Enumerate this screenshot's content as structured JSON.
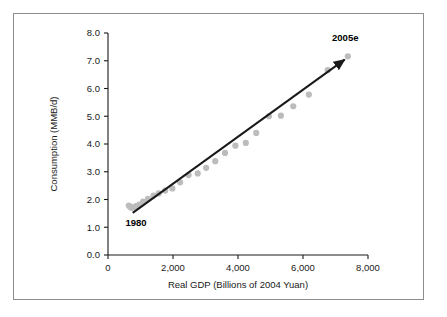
{
  "chart_data": {
    "type": "scatter",
    "title": "",
    "xlabel": "Real GDP (Billions of 2004 Yuan)",
    "ylabel": "Consumption (MMB/d)",
    "xlim": [
      0,
      8000
    ],
    "ylim": [
      0.0,
      8.0
    ],
    "xticks": [
      0,
      2000,
      4000,
      6000,
      8000
    ],
    "xtick_labels": [
      "0",
      "2,000",
      "4,000",
      "6,000",
      "8,000"
    ],
    "yticks": [
      0.0,
      1.0,
      2.0,
      3.0,
      4.0,
      5.0,
      6.0,
      7.0,
      8.0
    ],
    "ytick_labels": [
      "0.0",
      "1.0",
      "2.0",
      "3.0",
      "4.0",
      "5.0",
      "6.0",
      "7.0",
      "8.0"
    ],
    "grid": false,
    "legend": false,
    "marker_color": "#bcbcbc",
    "line_color": "#1a1a1a",
    "series": [
      {
        "name": "China oil consumption vs real GDP",
        "x": [
          640,
          680,
          720,
          780,
          860,
          960,
          1080,
          1230,
          1400,
          1560,
          1760,
          1980,
          2220,
          2480,
          2760,
          3020,
          3300,
          3600,
          3920,
          4240,
          4560,
          4950,
          5320,
          5700,
          6180,
          6760,
          7380
        ],
        "y": [
          1.78,
          1.74,
          1.7,
          1.72,
          1.76,
          1.82,
          1.92,
          2.02,
          2.14,
          2.22,
          2.32,
          2.4,
          2.62,
          2.88,
          2.94,
          3.14,
          3.38,
          3.68,
          3.94,
          4.04,
          4.4,
          5.0,
          5.02,
          5.36,
          5.78,
          6.66,
          7.16
        ]
      }
    ],
    "trendline": {
      "x0": 760,
      "y0": 1.52,
      "x1": 7280,
      "y1": 7.04,
      "arrow": true
    },
    "annotations": [
      {
        "text": "1980",
        "x": 860,
        "y": 1.05,
        "bold": true
      },
      {
        "text": "2005e",
        "x": 7300,
        "y": 7.7,
        "bold": true
      }
    ]
  }
}
